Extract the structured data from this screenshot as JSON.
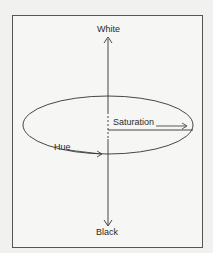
{
  "diagram": {
    "type": "hsv-color-space",
    "labels": {
      "top": "White",
      "bottom": "Black",
      "radius": "Saturation",
      "angle": "Hue"
    },
    "colors": {
      "background": "#f1f1ef",
      "line": "#333333"
    }
  }
}
